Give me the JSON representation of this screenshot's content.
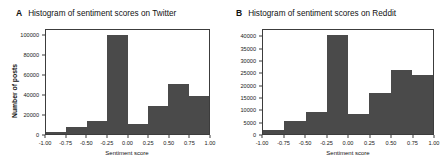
{
  "figure": {
    "background": "#ffffff",
    "bar_color": "#4a4a4a",
    "axis_color": "#3c3c3c",
    "panels": [
      {
        "letter": "A",
        "title": "Histogram of sentiment scores on Twitter"
      },
      {
        "letter": "B",
        "title": "Histogram of sentiment scores on Reddit"
      }
    ]
  },
  "chart_data": [
    {
      "type": "bar",
      "panel": "A",
      "title": "Histogram of sentiment scores on Twitter",
      "xlabel": "Sentiment score",
      "ylabel": "Number of posts",
      "grid": false,
      "legend": null,
      "xlim": [
        -1.0,
        1.0
      ],
      "ylim": [
        0,
        106000
      ],
      "bin_width": 0.25,
      "bin_edges": [
        -1.0,
        -0.75,
        -0.5,
        -0.25,
        0.0,
        0.25,
        0.5,
        0.75,
        1.0
      ],
      "categories": [
        "-1.00--0.75",
        "-0.75--0.50",
        "-0.50--0.25",
        "-0.25-0.00",
        "0.00-0.25",
        "0.25-0.50",
        "0.50-0.75",
        "0.75-1.00"
      ],
      "values": [
        2000,
        7000,
        13000,
        100500,
        10500,
        29000,
        50500,
        39000
      ],
      "xticks": [
        "-1.00",
        "-0.75",
        "-0.50",
        "-0.25",
        "0.00",
        "0.25",
        "0.50",
        "0.75",
        "1.00"
      ],
      "xtick_values": [
        -1.0,
        -0.75,
        -0.5,
        -0.25,
        0.0,
        0.25,
        0.5,
        0.75,
        1.0
      ],
      "yticks": [
        "0",
        "20000",
        "40000",
        "60000",
        "80000",
        "100000"
      ],
      "ytick_values": [
        0,
        20000,
        40000,
        60000,
        80000,
        100000
      ]
    },
    {
      "type": "bar",
      "panel": "B",
      "title": "Histogram of sentiment scores on Reddit",
      "xlabel": "Sentiment score",
      "ylabel": "",
      "grid": false,
      "legend": null,
      "xlim": [
        -1.0,
        1.0
      ],
      "ylim": [
        0,
        43000
      ],
      "bin_width": 0.25,
      "bin_edges": [
        -1.0,
        -0.75,
        -0.5,
        -0.25,
        0.0,
        0.25,
        0.5,
        0.75,
        1.0
      ],
      "categories": [
        "-1.00--0.75",
        "-0.75--0.50",
        "-0.50--0.25",
        "-0.25-0.00",
        "0.00-0.25",
        "0.25-0.50",
        "0.50-0.75",
        "0.75-1.00"
      ],
      "values": [
        1800,
        5300,
        9200,
        41000,
        8200,
        16800,
        26500,
        24500
      ],
      "xticks": [
        "-1.00",
        "-0.75",
        "-0.50",
        "-0.25",
        "0.00",
        "0.25",
        "0.50",
        "0.75",
        "1.00"
      ],
      "xtick_values": [
        -1.0,
        -0.75,
        -0.5,
        -0.25,
        0.0,
        0.25,
        0.5,
        0.75,
        1.0
      ],
      "yticks": [
        "0",
        "5000",
        "10000",
        "15000",
        "20000",
        "25000",
        "30000",
        "35000",
        "40000"
      ],
      "ytick_values": [
        0,
        5000,
        10000,
        15000,
        20000,
        25000,
        30000,
        35000,
        40000
      ]
    }
  ]
}
